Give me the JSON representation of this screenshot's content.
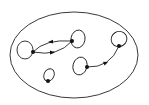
{
  "diagram": {
    "type": "directed-graph-with-self-loops",
    "colors": {
      "stroke": "#222222",
      "node": "#111111",
      "background": "#ffffff"
    },
    "boundary": {
      "shape": "ellipse",
      "cx": 74,
      "cy": 55,
      "rx": 64,
      "ry": 43
    },
    "nodes": [
      {
        "id": "n1",
        "x": 33,
        "y": 52,
        "loop": {
          "cx": 25,
          "cy": 50,
          "rx": 8,
          "ry": 9
        }
      },
      {
        "id": "n2",
        "x": 72,
        "y": 41,
        "loop": {
          "cx": 78,
          "cy": 39,
          "rx": 7,
          "ry": 9
        }
      },
      {
        "id": "n3",
        "x": 119,
        "y": 46,
        "loop": {
          "cx": 119,
          "cy": 39,
          "rx": 8,
          "ry": 8
        }
      },
      {
        "id": "n4",
        "x": 87,
        "y": 67,
        "loop": {
          "cx": 80,
          "cy": 66,
          "rx": 7,
          "ry": 9
        }
      },
      {
        "id": "n5",
        "x": 48,
        "y": 81,
        "loop": {
          "cx": 49,
          "cy": 75,
          "rx": 5,
          "ry": 6
        }
      }
    ],
    "edges": [
      {
        "from": "n2",
        "to": "n1",
        "path": "upper-arc",
        "arrow_direction": "left"
      },
      {
        "from": "n1",
        "to": "n2",
        "path": "lower-arc",
        "arrow_direction": "right"
      },
      {
        "from": "n4",
        "to": "n3",
        "path": "curve",
        "arrow_direction": "right"
      }
    ]
  }
}
